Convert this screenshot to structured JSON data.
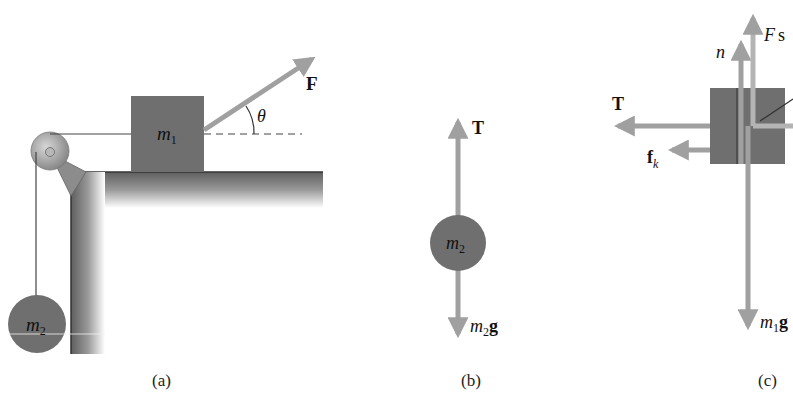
{
  "figure": {
    "panels": [
      {
        "id": "a",
        "caption": "(a)",
        "labels": {
          "block": "m",
          "block_sub": "1",
          "hanging_mass": "m",
          "hanging_mass_sub": "2",
          "force": "F",
          "angle": "θ"
        }
      },
      {
        "id": "b",
        "caption": "(b)",
        "labels": {
          "mass": "m",
          "mass_sub": "2",
          "tension": "T",
          "weight_m": "m",
          "weight_sub": "2",
          "weight_g": "g"
        }
      },
      {
        "id": "c",
        "caption": "(c)",
        "labels": {
          "normal": "n",
          "applied_force": "F",
          "applied_force_suffix": "s",
          "tension": "T",
          "friction": "f",
          "friction_sub": "k",
          "weight_m": "m",
          "weight_sub": "1",
          "weight_g": "g"
        }
      }
    ],
    "colors": {
      "arrow": "#a0a0a0",
      "mass_fill": "#6f6f6f",
      "pulley": "#9a9a9a",
      "table_dark": "#5a5a5a",
      "string": "#333333"
    }
  }
}
